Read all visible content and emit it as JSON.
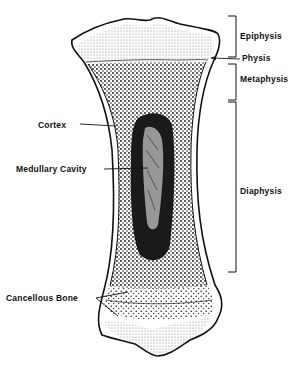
{
  "diagram": {
    "labels": {
      "epiphysis": "Epiphysis",
      "physis": "Physis",
      "metaphysis": "Metaphysis",
      "diaphysis": "Diaphysis",
      "cortex": "Cortex",
      "medullary_cavity": "Medullary Cavity",
      "cancellous_bone": "Cancellous Bone"
    },
    "colors": {
      "ink": "#111111",
      "background": "#ffffff",
      "cavity": "#1a1a1a"
    }
  }
}
